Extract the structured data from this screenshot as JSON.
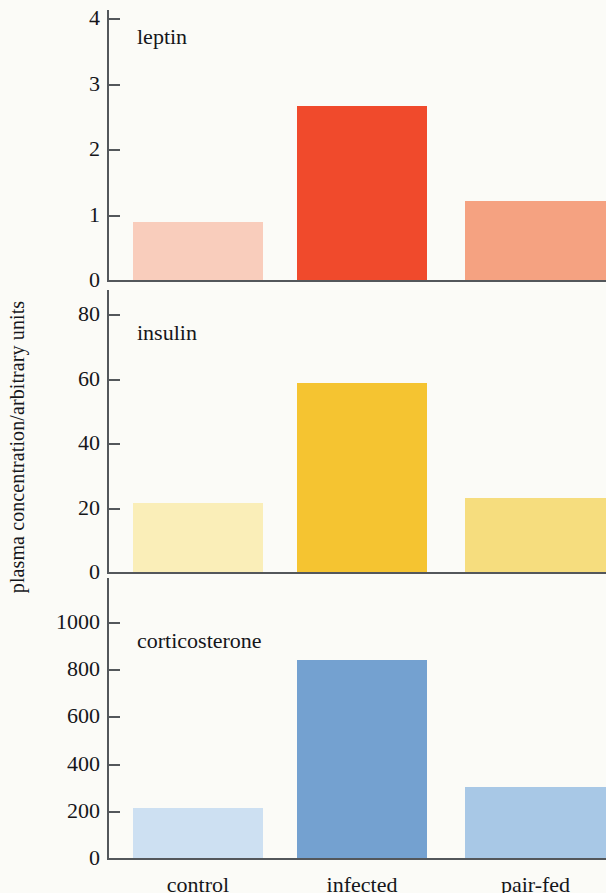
{
  "figure": {
    "ylabel": "plasma concentration/arbitrary units",
    "background": "#fbfbf7",
    "axis_color": "#53575b",
    "text_color": "#15161a"
  },
  "categories": [
    "control",
    "infected",
    "pair-fed"
  ],
  "chart_data": {
    "type": "bar",
    "title": "",
    "xlabel": "",
    "ylabel": "plasma concentration/arbitrary units",
    "grid": false,
    "legend": "none",
    "layout": "3 stacked panels sharing one x axis",
    "categories": [
      "control",
      "infected",
      "pair-fed"
    ],
    "panels": [
      {
        "name": "leptin",
        "label": "leptin",
        "ylim": [
          0,
          4
        ],
        "yticks": [
          0,
          1,
          2,
          3,
          4
        ],
        "ytick_labels": [
          "0",
          "1",
          "2",
          "3",
          "4"
        ],
        "values": [
          0.88,
          2.66,
          1.2
        ],
        "colors": [
          "#f9cdbc",
          "#f04a2c",
          "#f5a281"
        ]
      },
      {
        "name": "insulin",
        "label": "insulin",
        "ylim": [
          0,
          90
        ],
        "yticks": [
          0,
          20,
          40,
          60,
          80
        ],
        "ytick_labels": [
          "0",
          "20",
          "40",
          "60",
          "80"
        ],
        "values": [
          21.5,
          58.5,
          23
        ],
        "colors": [
          "#faeeb8",
          "#f5c431",
          "#f6dd7e"
        ]
      },
      {
        "name": "corticosterone",
        "label": "corticosterone",
        "ylim": [
          0,
          1150
        ],
        "yticks": [
          0,
          200,
          400,
          600,
          800,
          1000
        ],
        "ytick_labels": [
          "0",
          "200",
          "400",
          "600",
          "800",
          "1000"
        ],
        "values": [
          213,
          837,
          300
        ],
        "colors": [
          "#cde0f2",
          "#74a1d0",
          "#a8c8e6"
        ]
      }
    ]
  }
}
